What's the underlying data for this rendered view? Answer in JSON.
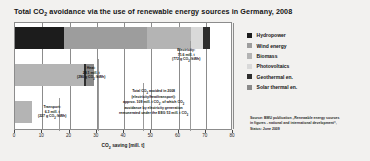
{
  "chart_data": {
    "type": "bar",
    "orientation": "horizontal",
    "stacked": true,
    "title": "Total CO2 avoidance via the use of renewable energy sources in Germany, 2008",
    "title_parts": {
      "pre": "Total CO",
      "sub": "2",
      "post": " avoidance via the use of renewable energy sources in Germany, 2008"
    },
    "xlabel": "CO2 saving [mill. t]",
    "xlabel_parts": {
      "pre": "CO",
      "sub": "2",
      "post": " saving [mill. t]"
    },
    "ylabel": "",
    "xlim": [
      0,
      80
    ],
    "xticks": [
      0,
      10,
      20,
      30,
      40,
      50,
      60,
      70,
      80
    ],
    "xtick_labels": [
      "0",
      "10",
      "20",
      "30",
      "40",
      "50",
      "60",
      "70",
      "80"
    ],
    "grid": true,
    "legend_position": "right",
    "categories": [
      "Electricity",
      "Heat",
      "Transport"
    ],
    "totals": [
      71.6,
      29.1,
      6.3
    ],
    "series": [
      {
        "name": "Hydropower",
        "color": "#1c1c1c",
        "values": [
          18.0,
          0.0,
          0.0
        ]
      },
      {
        "name": "Wind energy",
        "color": "#9d9d9d",
        "values": [
          30.3,
          0.0,
          0.0
        ]
      },
      {
        "name": "Biomass",
        "color": "#b4b4b4",
        "values": [
          16.3,
          25.4,
          6.3
        ]
      },
      {
        "name": "Photovoltaics",
        "color": "#d9d9d9",
        "values": [
          4.3,
          0.0,
          0.0
        ]
      },
      {
        "name": "Geothermal en.",
        "color": "#2e2e2e",
        "values": [
          2.7,
          0.6,
          0.0
        ]
      },
      {
        "name": "Solar thermal en.",
        "color": "#8a8a8a",
        "values": [
          0.0,
          3.1,
          0.0
        ]
      }
    ],
    "annotations": [
      {
        "key": "electricity",
        "lines": [
          "Electricity:",
          "71.6 mill. t",
          "(772 g CO2 /kWh)"
        ]
      },
      {
        "key": "heat",
        "lines": [
          "Heat:",
          "29.1 mill. t",
          "(290 g CO2 /kWh)"
        ]
      },
      {
        "key": "transport",
        "lines": [
          "Transport:",
          "6.3 mill. t",
          "(227 g CO2 /kWh)"
        ]
      },
      {
        "key": "total",
        "lines": [
          "Total CO2 avoided in 2008",
          "(electricity/heat/transport):",
          "approx. 109 mill. t CO2, of which CO2",
          "avoidance by electricity generation",
          "remunerated under the EEG 53 mill. t CO2"
        ]
      }
    ]
  },
  "legend": {
    "items": [
      {
        "label": "Hydropower",
        "color": "#1c1c1c"
      },
      {
        "label": "Wind energy",
        "color": "#9d9d9d"
      },
      {
        "label": "Biomass",
        "color": "#b4b4b4"
      },
      {
        "label": "Photovoltaics",
        "color": "#d9d9d9"
      },
      {
        "label": "Geothermal en.",
        "color": "#2e2e2e"
      },
      {
        "label": "Solar thermal en.",
        "color": "#8a8a8a"
      }
    ]
  },
  "callouts": {
    "electricity": {
      "l1": "Electricity:",
      "l2": "71.6 mill. t",
      "l3_pre": "(772 g CO",
      "l3_sub": "2",
      "l3_post": " /kWh)"
    },
    "heat": {
      "l1": "Heat:",
      "l2": "29.1 mill. t",
      "l3_pre": "(290 g CO",
      "l3_sub": "2",
      "l3_post": " /kWh)"
    },
    "transport": {
      "l1": "Transport:",
      "l2": "6.3 mill. t",
      "l3_pre": "(227 g CO",
      "l3_sub": "2",
      "l3_post": " /kWh)"
    },
    "total": {
      "l1_pre": "Total CO",
      "l1_sub": "2",
      "l1_post": " avoided in 2008",
      "l2": "(electricity/heat/transport):",
      "l3_pre": "approx. 109 mill. t CO",
      "l3_sub": "2",
      "l3_post": ", of which CO",
      "l3_sub2": "2",
      "l4": "avoidance by electricity generation",
      "l5_pre": "remunerated under the EEG 53 mill. t CO",
      "l5_sub": "2"
    }
  },
  "axis": {
    "title_pre": "CO",
    "title_sub": "2",
    "title_post": " saving [mill. t]",
    "labels": [
      "0",
      "10",
      "20",
      "30",
      "40",
      "50",
      "60",
      "70",
      "80"
    ]
  },
  "source": {
    "line1": "Source: BMU publication „Renewable energy sources",
    "line2": "in figures - national and international development“,",
    "line3": "Status: June 2009"
  },
  "colors": {
    "background": "#f2f1ef",
    "plot_background": "#ffffff",
    "frame": "#8c8c8c",
    "text": "#141414"
  }
}
